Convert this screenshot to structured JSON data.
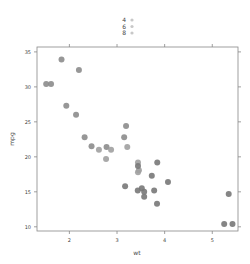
{
  "chart_data": {
    "type": "scatter",
    "title": "",
    "xlabel": "wt",
    "ylabel": "mpg",
    "xlim": [
      1.32,
      5.54
    ],
    "ylim": [
      9.4,
      35.7
    ],
    "xticks": [
      2,
      3,
      4,
      5
    ],
    "yticks": [
      10,
      15,
      20,
      25,
      30,
      35
    ],
    "grid": false,
    "legend": {
      "position": "top",
      "title": "",
      "entries": [
        "4",
        "6",
        "8"
      ]
    },
    "series": [
      {
        "name": "4",
        "color": "#8c8c8c",
        "points": [
          {
            "x": 2.32,
            "y": 22.8
          },
          {
            "x": 3.19,
            "y": 24.4
          },
          {
            "x": 3.15,
            "y": 22.8
          },
          {
            "x": 2.2,
            "y": 32.4
          },
          {
            "x": 1.615,
            "y": 30.4
          },
          {
            "x": 1.835,
            "y": 33.9
          },
          {
            "x": 2.465,
            "y": 21.5
          },
          {
            "x": 1.935,
            "y": 27.3
          },
          {
            "x": 2.14,
            "y": 26.0
          },
          {
            "x": 1.513,
            "y": 30.4
          },
          {
            "x": 2.78,
            "y": 21.4
          }
        ]
      },
      {
        "name": "6",
        "color": "#a0a0a0",
        "points": [
          {
            "x": 2.62,
            "y": 21.0
          },
          {
            "x": 2.875,
            "y": 21.0
          },
          {
            "x": 3.215,
            "y": 21.4
          },
          {
            "x": 3.46,
            "y": 18.1
          },
          {
            "x": 3.44,
            "y": 19.2
          },
          {
            "x": 3.44,
            "y": 17.8
          },
          {
            "x": 2.77,
            "y": 19.7
          }
        ]
      },
      {
        "name": "8",
        "color": "#787878",
        "points": [
          {
            "x": 3.44,
            "y": 18.7
          },
          {
            "x": 3.57,
            "y": 14.3
          },
          {
            "x": 4.07,
            "y": 16.4
          },
          {
            "x": 3.73,
            "y": 17.3
          },
          {
            "x": 3.78,
            "y": 15.2
          },
          {
            "x": 5.25,
            "y": 10.4
          },
          {
            "x": 5.424,
            "y": 10.4
          },
          {
            "x": 5.345,
            "y": 14.7
          },
          {
            "x": 3.52,
            "y": 15.5
          },
          {
            "x": 3.435,
            "y": 15.2
          },
          {
            "x": 3.84,
            "y": 13.3
          },
          {
            "x": 3.845,
            "y": 19.2
          },
          {
            "x": 3.17,
            "y": 15.8
          },
          {
            "x": 3.57,
            "y": 15.0
          }
        ]
      }
    ]
  },
  "colors": {
    "axis": "#888888",
    "text": "#444444",
    "legend_marker": "#c8c8c8"
  }
}
